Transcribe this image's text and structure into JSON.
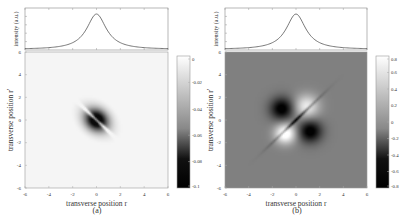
{
  "chart_data": [
    {
      "panel": "a",
      "caption": "(a)",
      "profile": {
        "type": "line",
        "ylabel": "intensity (a.u.)",
        "xlim": [
          -6,
          6
        ],
        "description": "Lorentzian-like intensity peak centered at r=0",
        "center": 0,
        "width": 1.0
      },
      "map": {
        "type": "heatmap",
        "xlabel": "transverse position r",
        "ylabel": "transverse position r'",
        "xlim": [
          -6,
          6
        ],
        "ylim": [
          -6,
          6
        ],
        "xticks": [
          "-6",
          "-4",
          "-2",
          "0",
          "2",
          "4",
          "6"
        ],
        "yticks": [
          "6",
          "4",
          "2",
          "0",
          "-2",
          "-4",
          "-6"
        ],
        "colormap": "gray",
        "clim": [
          -0.1,
          0
        ],
        "colorbar_ticks": [
          "0",
          "-0.02",
          "-0.04",
          "-0.06",
          "-0.08",
          "-0.1"
        ],
        "colorbar_values": [
          0,
          -0.02,
          -0.04,
          -0.06,
          -0.08,
          -0.1
        ],
        "description": "Two dark lobes along the anti-diagonal separated by a thin bright line along r=r'"
      }
    },
    {
      "panel": "b",
      "caption": "(b)",
      "profile": {
        "type": "line",
        "ylabel": "intensity (a.u.)",
        "xlim": [
          -6,
          6
        ],
        "description": "Lorentzian-like intensity peak centered at r=0",
        "center": 0,
        "width": 1.0
      },
      "map": {
        "type": "heatmap",
        "xlabel": "transverse position r",
        "ylabel": "transverse position r'",
        "xlim": [
          -6,
          6
        ],
        "ylim": [
          -6,
          6
        ],
        "xticks": [
          "-6",
          "-4",
          "-2",
          "0",
          "2",
          "4",
          "6"
        ],
        "yticks": [
          "6",
          "4",
          "2",
          "0",
          "-2",
          "-4",
          "-6"
        ],
        "colormap": "gray",
        "clim": [
          -0.8,
          0.8
        ],
        "colorbar_ticks": [
          "0.8",
          "0.6",
          "0.4",
          "0.2",
          "0",
          "-0.2",
          "-0.4",
          "-0.6",
          "-0.8"
        ],
        "colorbar_values": [
          0.8,
          0.6,
          0.4,
          0.2,
          0,
          -0.2,
          -0.4,
          -0.6,
          -0.8
        ],
        "description": "Quadrupole pattern: dark lobes upper-left and lower-right, bright lobes lower-left and upper-right, separated by a thin dark diagonal line"
      }
    }
  ]
}
